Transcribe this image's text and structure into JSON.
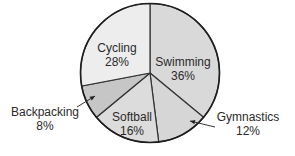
{
  "chart_data": {
    "type": "pie",
    "title": "",
    "start_angle_deg": 0,
    "direction": "clockwise",
    "categories": [
      "Swimming",
      "Gymnastics",
      "Softball",
      "Backpacking",
      "Cycling"
    ],
    "values": [
      36,
      12,
      16,
      8,
      28
    ],
    "unit": "%",
    "slices": [
      {
        "label": "Swimming",
        "value": 36,
        "value_label": "36%",
        "color": "#d9d9d9",
        "label_position": "inside"
      },
      {
        "label": "Gymnastics",
        "value": 12,
        "value_label": "12%",
        "color": "#d6d6d6",
        "label_position": "outside-arrow"
      },
      {
        "label": "Softball",
        "value": 16,
        "value_label": "16%",
        "color": "#dcdcdc",
        "label_position": "inside"
      },
      {
        "label": "Backpacking",
        "value": 8,
        "value_label": "8%",
        "color": "#c6c6c6",
        "label_position": "outside-arrow"
      },
      {
        "label": "Cycling",
        "value": 28,
        "value_label": "28%",
        "color": "#ededed",
        "label_position": "inside"
      }
    ],
    "legend": "none"
  },
  "geometry": {
    "cx": 150,
    "cy": 73,
    "r": 69.5
  },
  "labels": [
    {
      "name": "Swimming",
      "pct": "36%",
      "x": 183,
      "y1": 66,
      "y2": 80
    },
    {
      "name": "Gymnastics",
      "pct": "12%",
      "x": 248,
      "y1": 121,
      "y2": 135
    },
    {
      "name": "Softball",
      "pct": "16%",
      "x": 132,
      "y1": 121,
      "y2": 135
    },
    {
      "name": "Backpacking",
      "pct": "8%",
      "x": 45,
      "y1": 116,
      "y2": 130
    },
    {
      "name": "Cycling",
      "pct": "28%",
      "x": 117,
      "y1": 52,
      "y2": 66
    }
  ],
  "arrows": [
    {
      "target": "Backpacking",
      "from": [
        77,
        107
      ],
      "to": [
        95,
        96
      ]
    },
    {
      "target": "Gymnastics",
      "from": [
        215,
        127
      ],
      "to": [
        190,
        121
      ]
    }
  ]
}
